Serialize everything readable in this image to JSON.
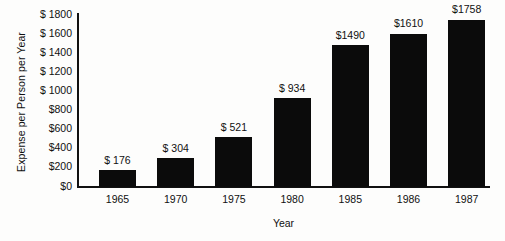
{
  "chart_data": {
    "type": "bar",
    "title": "",
    "xlabel": "Year",
    "ylabel": "Expense per Person per Year",
    "categories": [
      "1965",
      "1970",
      "1975",
      "1980",
      "1985",
      "1986",
      "1987"
    ],
    "values": [
      176,
      304,
      521,
      934,
      1490,
      1610,
      1758
    ],
    "value_labels": [
      "$ 176",
      "$ 304",
      "$ 521",
      "$ 934",
      "$1490",
      "$1610",
      "$1758"
    ],
    "ylim": [
      0,
      1800
    ],
    "ytick_values": [
      0,
      200,
      400,
      600,
      800,
      1000,
      1200,
      1400,
      1600,
      1800
    ],
    "ytick_labels": [
      "$0",
      "$200",
      "$400",
      "$600",
      "$800",
      "$ 1000",
      "$ 1200",
      "$ 1400",
      "$ 1600",
      "$ 1800"
    ],
    "grid": false,
    "legend": null,
    "bar_color": "#0b0b0b",
    "axis_color": "#111111",
    "background_color": "#fdfdfc"
  }
}
